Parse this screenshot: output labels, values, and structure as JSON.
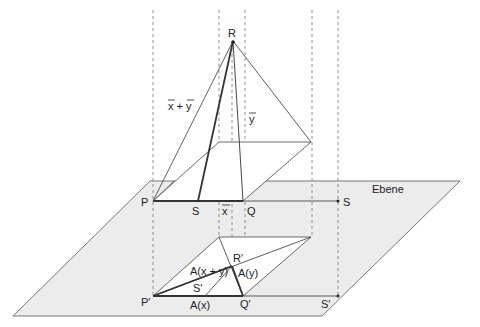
{
  "colors": {
    "plane_fill": "#ececec",
    "plane_stroke": "#777777",
    "line": "#333333",
    "dash": "#777777",
    "background": "#ffffff"
  },
  "labels": {
    "R": "R",
    "P": "P",
    "S_upper": "S",
    "Q": "Q",
    "S_right": "S",
    "x_vec": "x",
    "y_vec": "y",
    "x_plus_y": "x + y",
    "ebene": "Ebene",
    "R_prime": "R′",
    "P_prime": "P′",
    "S_prime": "S′",
    "Q_prime": "Q′",
    "S_prime_right": "S′",
    "A_x": "A(x)",
    "A_y": "A(y)",
    "A_x_plus_y": "A(x + y)"
  }
}
